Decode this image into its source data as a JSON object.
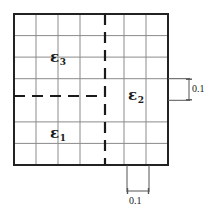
{
  "figure": {
    "colors": {
      "border": "#222222",
      "grid": "#8a8a8a",
      "dashed": "#1a1a1a",
      "dimension": "#555555",
      "text": "#1a1a1a",
      "background": "#ffffff"
    },
    "grid": {
      "columns": 7,
      "rows": 7,
      "left": 14,
      "top": 14,
      "right": 168,
      "bottom": 165,
      "cell_width": 22,
      "cell_height": 21.57
    },
    "partitions": {
      "vertical_dashed_x": 105,
      "horizontal_dashed_y": 96,
      "horizontal_dashed_x_start": 14,
      "horizontal_dashed_x_end": 105
    },
    "regions": [
      {
        "id": "eps3",
        "symbol": "ε",
        "subscript": "3",
        "description": "upper-left subregion"
      },
      {
        "id": "eps1",
        "symbol": "ε",
        "subscript": "1",
        "description": "lower-left subregion"
      },
      {
        "id": "eps2",
        "symbol": "ε",
        "subscript": "2",
        "description": "right subregion"
      }
    ],
    "dimensions": [
      {
        "id": "dim-right",
        "value": "0.1",
        "orientation": "vertical",
        "description": "cell height callout on right side"
      },
      {
        "id": "dim-bottom",
        "value": "0.1",
        "orientation": "horizontal",
        "description": "cell width callout below figure"
      }
    ]
  }
}
